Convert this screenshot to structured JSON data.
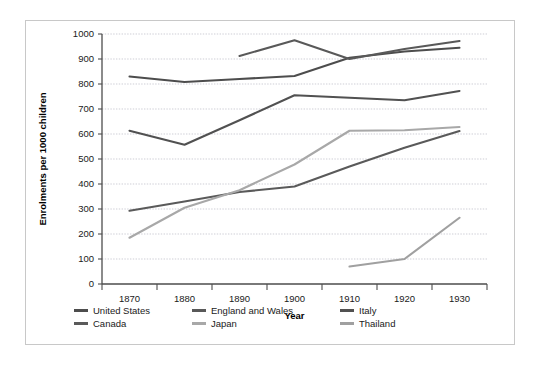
{
  "chart_data": {
    "type": "line",
    "title": "",
    "xlabel": "Year",
    "ylabel": "Enrolments per 1000 children",
    "x": [
      1870,
      1880,
      1890,
      1900,
      1910,
      1920,
      1930
    ],
    "xticklabels": [
      "1870",
      "1880",
      "1890",
      "1900",
      "1910",
      "1920",
      "1930"
    ],
    "yticklabels": [
      "0",
      "100",
      "200",
      "300",
      "400",
      "500",
      "600",
      "700",
      "800",
      "900",
      "1000"
    ],
    "ylim": [
      0,
      1000
    ],
    "ytick_step": 100,
    "grid": true,
    "legend_position": "bottom",
    "series": [
      {
        "name": "United States",
        "color": "#4d4d4d",
        "x": [
          1870,
          1880,
          1890,
          1900,
          1910,
          1920,
          1930
        ],
        "values": [
          830,
          808,
          820,
          832,
          905,
          930,
          945
        ]
      },
      {
        "name": "England and Wales",
        "color": "#595959",
        "x": [
          1890,
          1900,
          1910,
          1920,
          1930
        ],
        "values": [
          912,
          975,
          900,
          940,
          972
        ]
      },
      {
        "name": "Italy",
        "color": "#515151",
        "x": [
          1870,
          1880,
          1890,
          1900,
          1910,
          1920,
          1930
        ],
        "values": [
          613,
          557,
          655,
          755,
          745,
          735,
          772
        ]
      },
      {
        "name": "Canada",
        "color": "#5a5a5a",
        "x": [
          1870,
          1880,
          1890,
          1900,
          1910,
          1920,
          1930
        ],
        "values": [
          293,
          330,
          368,
          390,
          470,
          545,
          612
        ]
      },
      {
        "name": "Japan",
        "color": "#a8a8a8",
        "x": [
          1870,
          1880,
          1890,
          1900,
          1910,
          1920,
          1930
        ],
        "values": [
          185,
          305,
          375,
          478,
          613,
          615,
          628
        ]
      },
      {
        "name": "Thailand",
        "color": "#a0a0a0",
        "x": [
          1910,
          1920,
          1930
        ],
        "values": [
          70,
          100,
          265
        ]
      }
    ]
  },
  "legend": {
    "rows": [
      [
        {
          "label": "United States",
          "color": "#4d4d4d"
        },
        {
          "label": "England and Wales",
          "color": "#595959"
        },
        {
          "label": "Italy",
          "color": "#515151"
        }
      ],
      [
        {
          "label": "Canada",
          "color": "#5a5a5a"
        },
        {
          "label": "Japan",
          "color": "#a8a8a8"
        },
        {
          "label": "Thailand",
          "color": "#a0a0a0"
        }
      ]
    ]
  }
}
